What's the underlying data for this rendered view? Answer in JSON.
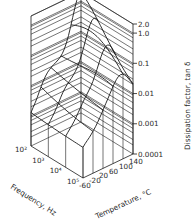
{
  "chart_data": {
    "type": "surface3d",
    "title": "",
    "x_axis": {
      "label": "Frequency, Hz",
      "ticks": [
        "10²",
        "10³",
        "10⁴",
        "10⁵"
      ],
      "values": [
        100,
        1000,
        10000,
        100000
      ],
      "scale": "log"
    },
    "y_axis": {
      "label": "Temperature, °C",
      "ticks": [
        "-60",
        "-20",
        "20",
        "60",
        "100",
        "140"
      ],
      "values": [
        -60,
        -20,
        20,
        60,
        100,
        140
      ]
    },
    "z_axis": {
      "label": "Dissipation factor, tan δ",
      "ticks": [
        "2.0",
        "1.0",
        "0.1",
        "0.01",
        "0.001",
        "0.0001"
      ],
      "values": [
        2.0,
        1.0,
        0.1,
        0.01,
        0.001,
        0.0001
      ],
      "scale": "log",
      "range": [
        0.0001,
        2.0
      ]
    },
    "surface_notes": "Dissipation factor peaks (~2.0) at low frequency / high temperature; drops toward ~0.01 plateau then ~0.001 at low temperature / high frequency",
    "grid": true
  }
}
